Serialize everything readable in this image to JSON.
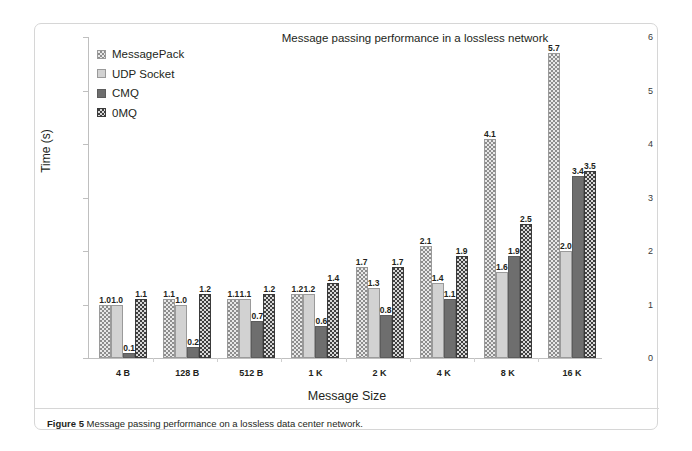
{
  "figure": {
    "caption_label": "Figure 5",
    "caption_text": "Message passing performance on a lossless data center network."
  },
  "chart_data": {
    "type": "bar",
    "title": "Message passing performance in a lossless network",
    "xlabel": "Message Size",
    "ylabel": "Time (s)",
    "ylim": [
      0,
      6
    ],
    "yticks": [
      0,
      1,
      2,
      3,
      4,
      5,
      6
    ],
    "ytick_labels": [
      "0",
      "1",
      "2",
      "3",
      "4",
      "5",
      "6"
    ],
    "grid": false,
    "legend_position": "upper-left",
    "categories": [
      "4 B",
      "128 B",
      "512 B",
      "1 K",
      "2 K",
      "4 K",
      "8 K",
      "16 K"
    ],
    "series": [
      {
        "name": "MessagePack",
        "color": "#e8e8e8",
        "pattern": "checkered-light",
        "values": [
          1.0,
          1.1,
          1.1,
          1.2,
          1.7,
          2.1,
          4.1,
          5.7
        ],
        "labels": [
          "1.0",
          "1.1",
          "1.1",
          "1.2",
          "1.7",
          "2.1",
          "4.1",
          "5.7"
        ]
      },
      {
        "name": "UDP Socket",
        "color": "#d2d2d2",
        "pattern": "solid-light",
        "values": [
          1.0,
          1.0,
          1.1,
          1.2,
          1.3,
          1.4,
          1.6,
          2.0
        ],
        "labels": [
          "1.0",
          "1.0",
          "1.1",
          "1.2",
          "1.3",
          "1.4",
          "1.6",
          "2.0"
        ]
      },
      {
        "name": "CMQ",
        "color": "#6e6e6e",
        "pattern": "solid-dark",
        "values": [
          0.1,
          0.2,
          0.7,
          0.6,
          0.8,
          1.1,
          1.9,
          3.4
        ],
        "labels": [
          "0.1",
          "0.2",
          "0.7",
          "0.6",
          "0.8",
          "1.1",
          "1.9",
          "3.4"
        ]
      },
      {
        "name": "0MQ",
        "color": "#3f3f3f",
        "pattern": "checkered-dark",
        "values": [
          1.1,
          1.2,
          1.2,
          1.4,
          1.7,
          1.9,
          2.5,
          3.5
        ],
        "labels": [
          "1.1",
          "1.2",
          "1.2",
          "1.4",
          "1.7",
          "1.9",
          "2.5",
          "3.5"
        ]
      }
    ]
  }
}
